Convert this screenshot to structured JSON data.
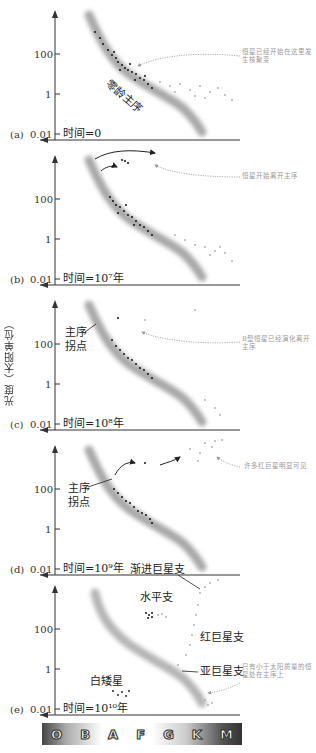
{
  "figure": {
    "y_axis_label": "光度（太阳单位）",
    "y_ticks": [
      "100",
      "1",
      "0.01"
    ],
    "spectral_classes": [
      "O",
      "B",
      "A",
      "F",
      "G",
      "K",
      "M"
    ]
  },
  "panels": [
    {
      "id": "a",
      "tag": "(a)",
      "time_label": "时间=0",
      "labels": [
        "零龄主序"
      ],
      "note": "恒星已经开始在这里发生核聚变"
    },
    {
      "id": "b",
      "tag": "(b)",
      "time_label": "时间=10⁷年",
      "labels": [],
      "note": "恒星开始离开主序"
    },
    {
      "id": "c",
      "tag": "(c)",
      "time_label": "时间=10⁸年",
      "labels": [
        "主序",
        "拐点"
      ],
      "note": "B型恒星已经演化离开主序"
    },
    {
      "id": "d",
      "tag": "(d)",
      "time_label": "时间=10⁹年",
      "labels": [
        "主序",
        "拐点"
      ],
      "note": "许多红巨星明显可见"
    },
    {
      "id": "e",
      "tag": "(e)",
      "time_label": "时间=10¹⁰年",
      "labels": [
        "渐进巨星支",
        "水平支",
        "红巨星支",
        "亚巨星支",
        "白矮星"
      ],
      "note": "只有小于太阳质量的恒星处在主序上"
    }
  ],
  "colors": {
    "main_sequence_band": "#b0b0b0",
    "young_stars": "#111111",
    "faint_stars": "#aaaaaa",
    "note_text": "#999999"
  }
}
